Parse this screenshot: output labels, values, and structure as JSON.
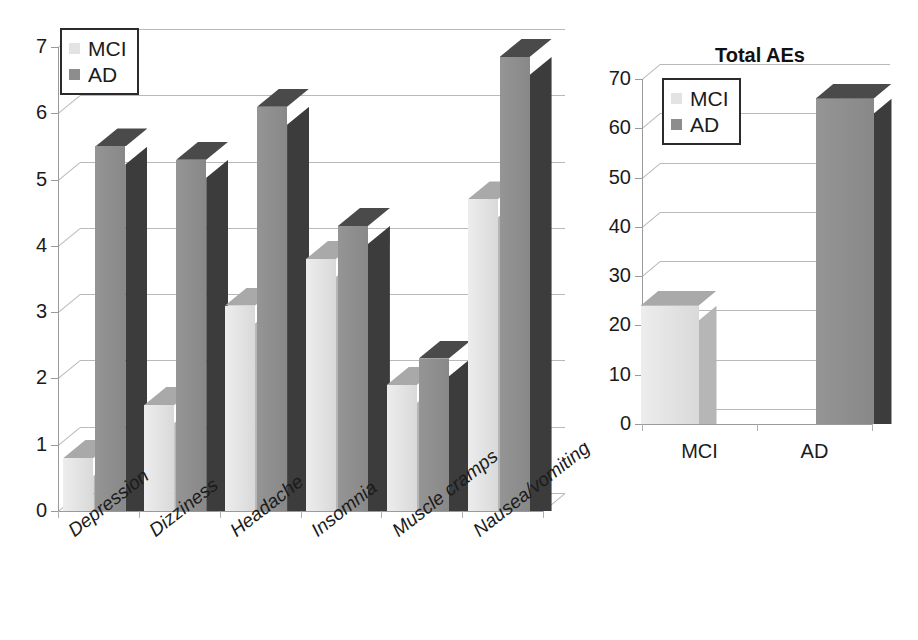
{
  "legend": {
    "items": [
      {
        "label": "MCI",
        "color": "#e3e3e3",
        "icon": "legend-swatch-mci"
      },
      {
        "label": "AD",
        "color": "#8d8d8d",
        "icon": "legend-swatch-ad"
      }
    ]
  },
  "left_chart": {
    "title": "",
    "y_axis_labels": [
      "7",
      "6",
      "5",
      "4",
      "3",
      "2",
      "1",
      "0"
    ],
    "category_labels": [
      "Depression",
      "Dizziness",
      "Headache",
      "Insomnia",
      "Muscle cramps",
      "Nausea/vomiting"
    ],
    "series_labels": [
      "MCI",
      "AD"
    ]
  },
  "right_chart": {
    "title": "Total AEs",
    "y_axis_labels": [
      "70",
      "60",
      "50",
      "40",
      "30",
      "20",
      "10",
      "0"
    ],
    "category_labels": [
      "MCI",
      "AD"
    ],
    "series_labels": [
      "MCI",
      "AD"
    ]
  },
  "colors": {
    "mci_front": "#e4e4e4",
    "mci_side": "#b6b6b6",
    "mci_top": "#a9a9a9",
    "ad_front": "#8f8f8f",
    "ad_side": "#3c3c3c",
    "ad_top": "#4a4a4a",
    "gridline": "#b9b9b9",
    "axis": "#9a9a9a",
    "text": "#1b1b1b"
  },
  "chart_data": [
    {
      "type": "bar",
      "title": "",
      "subtitle": "",
      "xlabel": "",
      "ylabel": "",
      "ylim": [
        0,
        7
      ],
      "ytick_step": 1,
      "grid": true,
      "legend_position": "top-left",
      "three_d": true,
      "categories": [
        "Depression",
        "Dizziness",
        "Headache",
        "Insomnia",
        "Muscle cramps",
        "Nausea/vomiting"
      ],
      "series": [
        {
          "name": "MCI",
          "color": "#e4e4e4",
          "values": [
            0.8,
            1.6,
            3.1,
            3.8,
            1.9,
            4.7
          ]
        },
        {
          "name": "AD",
          "color": "#8f8f8f",
          "values": [
            5.5,
            5.3,
            6.1,
            4.3,
            2.3,
            6.85
          ]
        }
      ]
    },
    {
      "type": "bar",
      "title": "Total AEs",
      "subtitle": "",
      "xlabel": "",
      "ylabel": "",
      "ylim": [
        0,
        70
      ],
      "ytick_step": 10,
      "grid": true,
      "legend_position": "top-left",
      "three_d": true,
      "categories": [
        "MCI",
        "AD"
      ],
      "series": [
        {
          "name": "MCI",
          "color": "#e4e4e4",
          "values": [
            24,
            null
          ]
        },
        {
          "name": "AD",
          "color": "#8f8f8f",
          "values": [
            null,
            66
          ]
        }
      ]
    }
  ]
}
